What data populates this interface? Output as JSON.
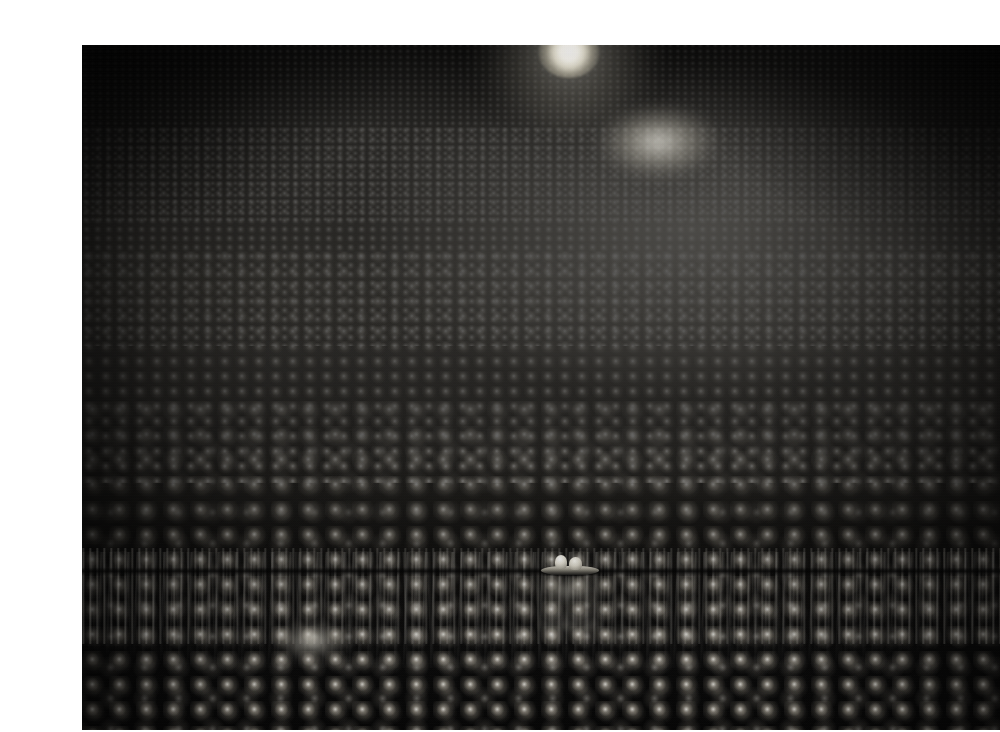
{
  "page": {
    "background_color": "#ffffff",
    "width": 1000,
    "height": 732
  },
  "photograph": {
    "subject": "Super-Kamiokande neutrino detector interior",
    "description": "Interior of a vast cylindrical underground water Cherenkov detector tank. The curved walls and domed ceiling are completely tiled with thousands of large spherical photomultiplier tubes arranged in a regular grid. The tank is partially filled with ultrapure water; a small inflatable boat carrying two workers floats on the mirror-like surface near the centre, with the tube array reflected beneath it.",
    "frame": {
      "left": 42,
      "top": 29,
      "width": 921,
      "height": 685,
      "border_color": "#ffffff"
    },
    "palette": {
      "deep_shadow": "#050505",
      "tank_dark": "#1b1a18",
      "tank_mid": "#55524c",
      "tank_light": "#767268",
      "specular_highlight": "#fffdf6",
      "pmt_body": "#8a8478",
      "water_streak": "#e6e4dc"
    },
    "elements": {
      "dome_ceiling": "dome-ceiling",
      "curved_wall": "tank-wall",
      "pmt_array": "photomultiplier-tube-array",
      "water_surface": "water-surface",
      "waterline": "waterline",
      "boat": "inflatable-boat",
      "workers": [
        "worker-left",
        "worker-right"
      ],
      "reflection": "boat-reflection"
    },
    "light_sources": [
      {
        "name": "ceiling-lamp-primary",
        "x_pct": 52.9,
        "y_pct": 1.0,
        "intensity": "brightest",
        "color": "#ffffff"
      },
      {
        "name": "ceiling-lamp-secondary-glow",
        "x_pct": 62.5,
        "y_pct": 14.2,
        "intensity": "diffuse",
        "color": "#fffdf4"
      },
      {
        "name": "floor-lamp-glow",
        "x_pct": 25.0,
        "y_pct": 87.0,
        "intensity": "soft",
        "color": "#fffcf0"
      },
      {
        "name": "water-surface-reflection",
        "x_pct": 53.0,
        "y_pct": 79.5,
        "intensity": "faint",
        "color": "#ece8da"
      }
    ],
    "pmt_grid_layers": [
      {
        "name": "pmt-layer-dome",
        "cell_px": 7.5,
        "zone": "ceiling"
      },
      {
        "name": "pmt-layer-far",
        "cell_px": 11.0,
        "zone": "upper-wall"
      },
      {
        "name": "pmt-layer-mid",
        "cell_px": 17.0,
        "zone": "mid-wall"
      },
      {
        "name": "pmt-layer-near",
        "cell_px": 27.0,
        "zone": "lower-wall-and-floor"
      }
    ]
  }
}
